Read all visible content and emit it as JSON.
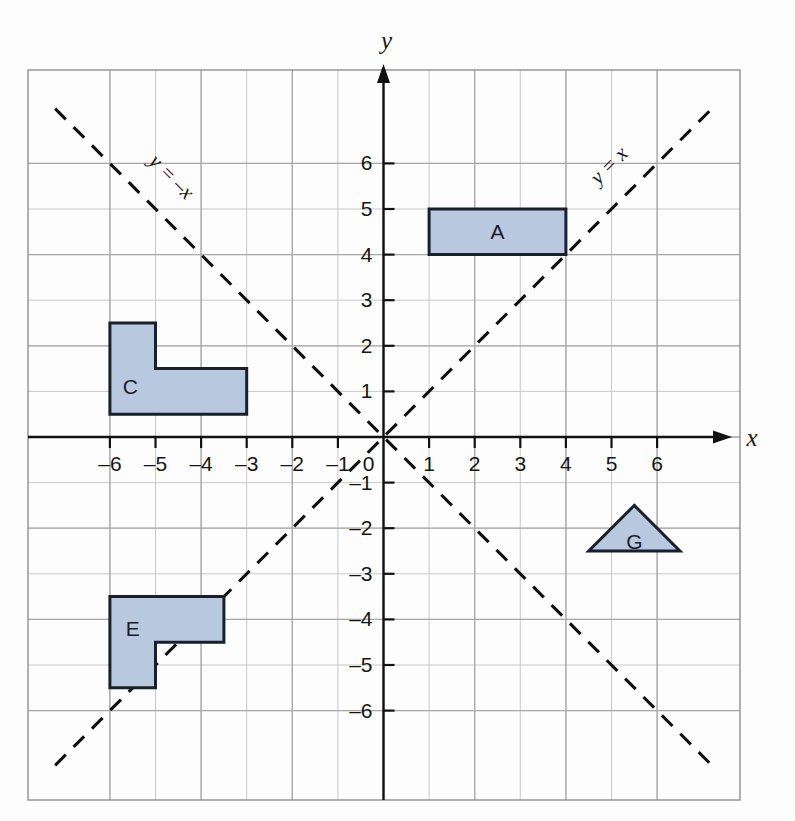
{
  "figure": {
    "kind": "coordinate-grid-diagram",
    "background_color": "#fdfdfd",
    "grid_color": "#a8a8a8",
    "minor_grid_color": "#c9c9c9",
    "axis_color": "#111111",
    "shape_fill": "#b8c8de",
    "shape_stroke": "#19202c",
    "dash_line_color": "#111111"
  },
  "axes": {
    "x_axis_label": "x",
    "y_axis_label": "y",
    "origin_label": "0",
    "x_min": -6.85,
    "x_max": 6.85,
    "y_min": -6.85,
    "y_max": 6.85,
    "x_ticks": [
      {
        "value": -6,
        "label": "–6"
      },
      {
        "value": -5,
        "label": "–5"
      },
      {
        "value": -4,
        "label": "–4"
      },
      {
        "value": -3,
        "label": "–3"
      },
      {
        "value": -2,
        "label": "–2"
      },
      {
        "value": -1,
        "label": "–1"
      },
      {
        "value": 1,
        "label": "1"
      },
      {
        "value": 2,
        "label": "2"
      },
      {
        "value": 3,
        "label": "3"
      },
      {
        "value": 4,
        "label": "4"
      },
      {
        "value": 5,
        "label": "5"
      },
      {
        "value": 6,
        "label": "6"
      }
    ],
    "y_ticks": [
      {
        "value": 6,
        "label": "6"
      },
      {
        "value": 5,
        "label": "5"
      },
      {
        "value": 4,
        "label": "4"
      },
      {
        "value": 3,
        "label": "3"
      },
      {
        "value": 2,
        "label": "2"
      },
      {
        "value": 1,
        "label": "1"
      },
      {
        "value": -1,
        "label": "–1"
      },
      {
        "value": -2,
        "label": "–2"
      },
      {
        "value": -3,
        "label": "–3"
      },
      {
        "value": -4,
        "label": "–4"
      },
      {
        "value": -5,
        "label": "–5"
      },
      {
        "value": -6,
        "label": "–6"
      }
    ]
  },
  "mirror_lines": [
    {
      "name": "line-y-equals-x",
      "equation_label": "y = x",
      "slope": 1,
      "intercept": 0,
      "label_position": {
        "x": 5.05,
        "y": 5.85
      },
      "label_rotation": -45
    },
    {
      "name": "line-y-equals-minus-x",
      "equation_label": "y = –x",
      "slope": -1,
      "intercept": 0,
      "label_position": {
        "x": -4.75,
        "y": 5.6
      },
      "label_rotation": 45
    }
  ],
  "shapes": [
    {
      "name": "shape-a-rectangle",
      "letter": "A",
      "letter_position": {
        "x": 2.5,
        "y": 4.5
      },
      "points": [
        [
          1,
          4
        ],
        [
          4,
          4
        ],
        [
          4,
          5
        ],
        [
          1,
          5
        ]
      ]
    },
    {
      "name": "shape-c-l-shape",
      "letter": "C",
      "letter_position": {
        "x": -5.55,
        "y": 1.1
      },
      "points": [
        [
          -6,
          0.5
        ],
        [
          -3,
          0.5
        ],
        [
          -3,
          1.5
        ],
        [
          -5,
          1.5
        ],
        [
          -5,
          2.5
        ],
        [
          -6,
          2.5
        ]
      ]
    },
    {
      "name": "shape-e-l-shape",
      "letter": "E",
      "letter_position": {
        "x": -5.5,
        "y": -4.2
      },
      "points": [
        [
          -6,
          -5.5
        ],
        [
          -5,
          -5.5
        ],
        [
          -5,
          -4.5
        ],
        [
          -3.5,
          -4.5
        ],
        [
          -3.5,
          -3.5
        ],
        [
          -6,
          -3.5
        ]
      ]
    },
    {
      "name": "shape-g-triangle",
      "letter": "G",
      "letter_position": {
        "x": 5.5,
        "y": -2.3
      },
      "points": [
        [
          4.5,
          -2.5
        ],
        [
          6.5,
          -2.5
        ],
        [
          5.5,
          -1.5
        ]
      ]
    }
  ]
}
